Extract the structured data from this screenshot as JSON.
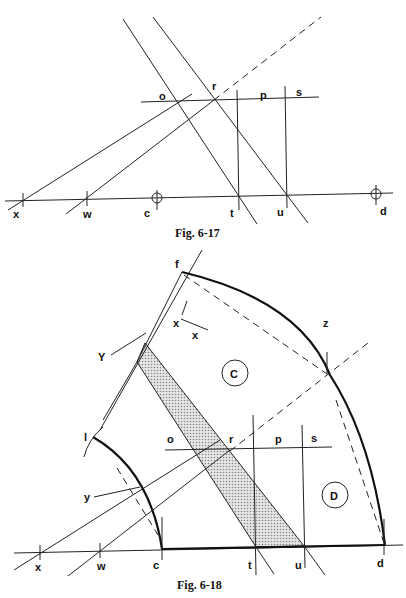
{
  "fig17": {
    "caption": "Fig. 6-17",
    "labels": {
      "o": "o",
      "r": "r",
      "p": "p",
      "s": "s",
      "x": "x",
      "w": "w",
      "c": "c",
      "t": "t",
      "u": "u",
      "d": "d"
    }
  },
  "fig18": {
    "caption": "Fig. 6-18",
    "labels": {
      "f": "f",
      "z": "z",
      "Y": "Y",
      "y": "y",
      "l": "l",
      "o": "o",
      "r": "r",
      "p": "p",
      "s": "s",
      "x": "x",
      "w": "w",
      "c": "c",
      "t": "t",
      "u": "u",
      "d": "d",
      "x1": "x",
      "x2": "x"
    },
    "regions": {
      "C": "C",
      "D": "D"
    }
  },
  "colors": {
    "line": "#222222",
    "shade": "#c8c8c8",
    "background": "#ffffff"
  }
}
